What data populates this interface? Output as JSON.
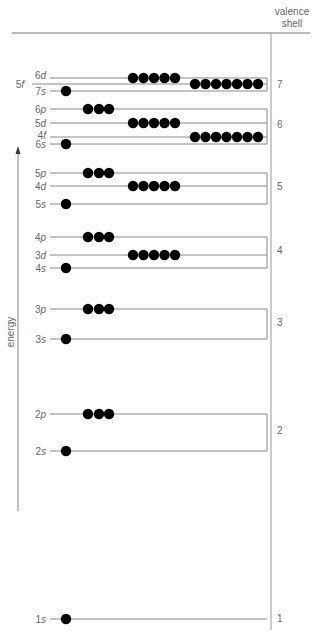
{
  "header": {
    "valence_line1": "valence",
    "valence_line2": "shell"
  },
  "axis": {
    "energy_label": "energy"
  },
  "colors": {
    "line": "#888888",
    "electron": "#000000",
    "text": "#666666"
  },
  "levels": [
    {
      "id": "6d",
      "num": "6",
      "sub": "d",
      "shell": 7,
      "electrons": 5,
      "type": "d"
    },
    {
      "id": "5f",
      "num": "5",
      "sub": "f",
      "shell": 7,
      "electrons": 7,
      "type": "f"
    },
    {
      "id": "7s",
      "num": "7",
      "sub": "s",
      "shell": 7,
      "electrons": 1,
      "type": "s"
    },
    {
      "id": "6p",
      "num": "6",
      "sub": "p",
      "shell": 6,
      "electrons": 3,
      "type": "p"
    },
    {
      "id": "5d",
      "num": "5",
      "sub": "d",
      "shell": 6,
      "electrons": 5,
      "type": "d"
    },
    {
      "id": "4f",
      "num": "4",
      "sub": "f",
      "shell": 6,
      "electrons": 7,
      "type": "f"
    },
    {
      "id": "6s",
      "num": "6",
      "sub": "s",
      "shell": 6,
      "electrons": 1,
      "type": "s"
    },
    {
      "id": "5p",
      "num": "5",
      "sub": "p",
      "shell": 5,
      "electrons": 3,
      "type": "p"
    },
    {
      "id": "4d",
      "num": "4",
      "sub": "d",
      "shell": 5,
      "electrons": 5,
      "type": "d"
    },
    {
      "id": "5s",
      "num": "5",
      "sub": "s",
      "shell": 5,
      "electrons": 1,
      "type": "s"
    },
    {
      "id": "4p",
      "num": "4",
      "sub": "p",
      "shell": 4,
      "electrons": 3,
      "type": "p"
    },
    {
      "id": "3d",
      "num": "3",
      "sub": "d",
      "shell": 4,
      "electrons": 5,
      "type": "d"
    },
    {
      "id": "4s",
      "num": "4",
      "sub": "s",
      "shell": 4,
      "electrons": 1,
      "type": "s"
    },
    {
      "id": "3p",
      "num": "3",
      "sub": "p",
      "shell": 3,
      "electrons": 3,
      "type": "p"
    },
    {
      "id": "3s",
      "num": "3",
      "sub": "s",
      "shell": 3,
      "electrons": 1,
      "type": "s"
    },
    {
      "id": "2p",
      "num": "2",
      "sub": "p",
      "shell": 2,
      "electrons": 3,
      "type": "p"
    },
    {
      "id": "2s",
      "num": "2",
      "sub": "s",
      "shell": 2,
      "electrons": 1,
      "type": "s"
    },
    {
      "id": "1s",
      "num": "1",
      "sub": "s",
      "shell": 1,
      "electrons": 1,
      "type": "s"
    }
  ],
  "shells": [
    {
      "label": "7",
      "levels": [
        "6d",
        "5f",
        "7s"
      ]
    },
    {
      "label": "6",
      "levels": [
        "6p",
        "5d",
        "4f",
        "6s"
      ]
    },
    {
      "label": "5",
      "levels": [
        "5p",
        "4d",
        "5s"
      ]
    },
    {
      "label": "4",
      "levels": [
        "4p",
        "3d",
        "4s"
      ]
    },
    {
      "label": "3",
      "levels": [
        "3p",
        "3s"
      ]
    },
    {
      "label": "2",
      "levels": [
        "2p",
        "2s"
      ]
    },
    {
      "label": "1",
      "levels": [
        "1s"
      ]
    }
  ]
}
